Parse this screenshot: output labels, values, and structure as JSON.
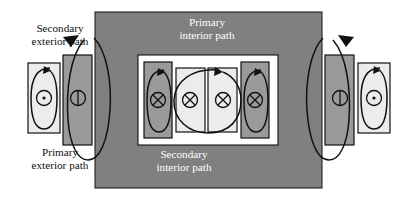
{
  "figure": {
    "kind": "magnetic-flux-path-diagram",
    "width": 404,
    "height": 203,
    "background_color": "#ffffff"
  },
  "labels": {
    "secondary_exterior": "Secondary\nexterior path",
    "primary_exterior": "Primary\nexterior path",
    "primary_interior": "Primary\ninterior path",
    "secondary_interior": "Secondary\ninterior path"
  },
  "colors": {
    "outer_panel": "#808080",
    "inner_frame": "#ffffff",
    "box_light": "#ececec",
    "box_mid": "#9a9a9a",
    "stroke": "#111111",
    "label_dark": "#111111",
    "label_light": "#ffffff"
  },
  "panels": {
    "outer": {
      "x": 95,
      "y": 12,
      "width": 227,
      "height": 176,
      "fill": "#808080"
    },
    "inner_frame": {
      "x": 138,
      "y": 55,
      "width": 140,
      "height": 90,
      "fill": "#ffffff"
    }
  },
  "cores": [
    {
      "name": "outer-left-primary",
      "symbol": "dot",
      "fill": "#ececec",
      "x": 28,
      "y": 63,
      "width": 32,
      "height": 70
    },
    {
      "name": "left-secondary",
      "symbol": "line",
      "fill": "#9a9a9a",
      "x": 63,
      "y": 55,
      "width": 29,
      "height": 90
    },
    {
      "name": "inner-left-secondary",
      "symbol": "cross",
      "fill": "#9a9a9a",
      "x": 144,
      "y": 62,
      "width": 28,
      "height": 76
    },
    {
      "name": "inner-mid-left-primary",
      "symbol": "cross",
      "fill": "#ececec",
      "x": 176,
      "y": 68,
      "width": 29,
      "height": 64
    },
    {
      "name": "inner-mid-right-primary",
      "symbol": "cross",
      "fill": "#ececec",
      "x": 208,
      "y": 68,
      "width": 29,
      "height": 64
    },
    {
      "name": "inner-right-secondary",
      "symbol": "cross",
      "fill": "#9a9a9a",
      "x": 241,
      "y": 62,
      "width": 28,
      "height": 76
    },
    {
      "name": "right-secondary",
      "symbol": "line",
      "fill": "#9a9a9a",
      "x": 325,
      "y": 55,
      "width": 29,
      "height": 90
    },
    {
      "name": "outer-right-primary",
      "symbol": "dot",
      "fill": "#ececec",
      "x": 358,
      "y": 63,
      "width": 32,
      "height": 70
    }
  ],
  "symbols": {
    "dot": "current out of page",
    "cross": "current into page",
    "line": "flux line through core"
  },
  "flux_loops": [
    {
      "name": "primary-exterior-loop-left",
      "path": "ellipse",
      "cx": 44,
      "cy": 98,
      "rx": 13,
      "ry": 32
    },
    {
      "name": "primary-exterior-loop-right",
      "path": "ellipse",
      "cx": 374,
      "cy": 98,
      "rx": 13,
      "ry": 32
    },
    {
      "name": "secondary-exterior-loop-left",
      "path": "ellipse",
      "cx": 95,
      "cy": 100,
      "rx": 18,
      "ry": 62
    },
    {
      "name": "secondary-exterior-loop-right",
      "path": "ellipse",
      "cx": 322,
      "cy": 100,
      "rx": 18,
      "ry": 62
    },
    {
      "name": "secondary-interior-loop-left",
      "path": "ellipse",
      "cx": 158,
      "cy": 100,
      "rx": 12,
      "ry": 33
    },
    {
      "name": "secondary-interior-loop-right",
      "path": "ellipse",
      "cx": 255,
      "cy": 100,
      "rx": 12,
      "ry": 33
    },
    {
      "name": "primary-interior-loop",
      "path": "ellipse",
      "cx": 207,
      "cy": 100,
      "rx": 35,
      "ry": 33
    }
  ]
}
